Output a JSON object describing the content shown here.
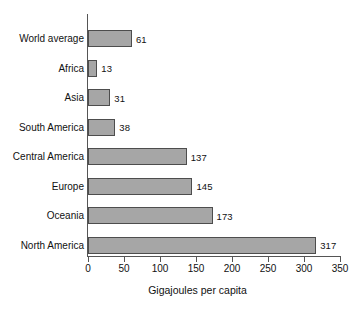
{
  "chart_data": {
    "type": "bar",
    "orientation": "horizontal",
    "title": "",
    "xlabel": "Gigajoules per capita",
    "ylabel": "",
    "categories": [
      "World average",
      "Africa",
      "Asia",
      "South America",
      "Central America",
      "Europe",
      "Oceania",
      "North America"
    ],
    "values": [
      61,
      13,
      31,
      38,
      137,
      145,
      173,
      317
    ],
    "value_labels": [
      "61",
      "13",
      "31",
      "38",
      "137",
      "145",
      "173",
      "317"
    ],
    "xlim": [
      0,
      350
    ],
    "xticks": [
      0,
      50,
      100,
      150,
      200,
      250,
      300,
      350
    ],
    "xtick_labels": [
      "0",
      "50",
      "100",
      "150",
      "200",
      "250",
      "300",
      "350"
    ],
    "grid": false,
    "legend": null,
    "colors": {
      "bar_fill": "#a6a6a6",
      "bar_border": "#4d4d4d",
      "axis": "#555555",
      "text": "#111111",
      "background": "#ffffff"
    }
  }
}
